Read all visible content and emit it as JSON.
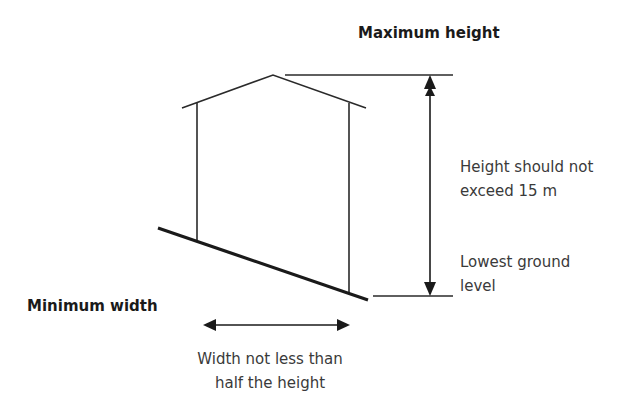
{
  "diagram": {
    "title_top": "Maximum height",
    "title_left": "Minimum width",
    "height_label": [
      "Height should not",
      "exceed 15 m"
    ],
    "ground_label": [
      "Lowest ground",
      "level"
    ],
    "width_label": [
      "Width not less than",
      "half the height"
    ],
    "line_color": "#1a1a1a"
  }
}
